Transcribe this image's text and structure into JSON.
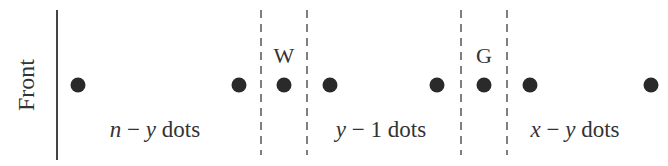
{
  "front_label": "Front",
  "markers": {
    "w": "W",
    "g": "G"
  },
  "groups": [
    {
      "var1": "n",
      "op": " − ",
      "var2": "y",
      "suffix": " dots"
    },
    {
      "var1": "y",
      "op": " − ",
      "var2": "1",
      "suffix": " dots"
    },
    {
      "var1": "x",
      "op": " − ",
      "var2": "y",
      "suffix": " dots"
    }
  ],
  "colors": {
    "ink": "#333333",
    "dot": "#2a2a2a"
  }
}
